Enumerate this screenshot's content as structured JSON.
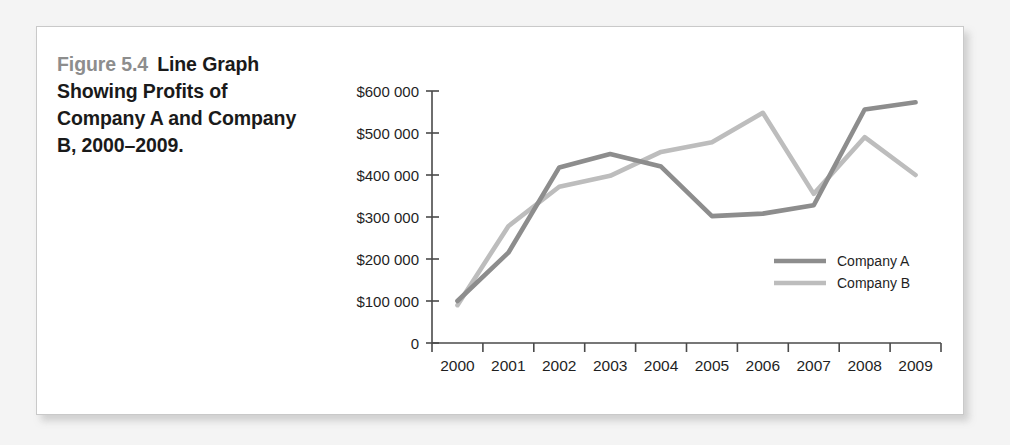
{
  "figure": {
    "number_label": "Figure 5.4",
    "caption_text": "Line Graph Showing Profits of Company A and Company B, 2000–2009."
  },
  "chart_data": {
    "type": "line",
    "title": "",
    "xlabel": "",
    "ylabel": "",
    "categories": [
      "2000",
      "2001",
      "2002",
      "2003",
      "2004",
      "2005",
      "2006",
      "2007",
      "2008",
      "2009"
    ],
    "ylim": [
      0,
      600000
    ],
    "ytick_labels": [
      "$600 000",
      "$500 000",
      "$400 000",
      "$300 000",
      "$200 000",
      "$100 000",
      "0"
    ],
    "ytick_values": [
      600000,
      500000,
      400000,
      300000,
      200000,
      100000,
      0
    ],
    "grid": false,
    "legend_position": "right-inside",
    "series": [
      {
        "name": "Company A",
        "color": "#8d8d8d",
        "values": [
          100000,
          215000,
          418000,
          450000,
          420000,
          302000,
          308000,
          328000,
          556000,
          573000
        ]
      },
      {
        "name": "Company B",
        "color": "#bdbdbd",
        "values": [
          90000,
          278000,
          372000,
          398000,
          455000,
          478000,
          548000,
          355000,
          490000,
          400000
        ]
      }
    ]
  },
  "colors": {
    "page_background": "#f4f4f4",
    "figure_background": "#ffffff",
    "figure_border": "#c9c9c9",
    "caption_number": "#8d8d8d",
    "caption_text": "#1a1a1a",
    "axis": "#4a4a4a"
  }
}
